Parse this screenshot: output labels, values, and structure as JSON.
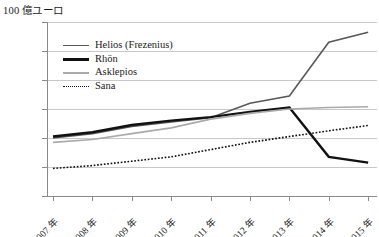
{
  "axis_unit_label": "100 億ユーロ",
  "legend": {
    "position": "upper-left-inside",
    "entries": [
      {
        "label": "Helios (Frezenius)",
        "color": "#595959",
        "style": "solid",
        "width": 1.6
      },
      {
        "label": "Rhön",
        "color": "#111111",
        "style": "solid",
        "width": 2.4
      },
      {
        "label": "Asklepios",
        "color": "#aaaaaa",
        "style": "solid",
        "width": 1.6
      },
      {
        "label": "Sana",
        "color": "#111111",
        "style": "dotted",
        "width": 1.6
      }
    ]
  },
  "chart_data": {
    "type": "line",
    "title": "",
    "xlabel": "",
    "ylabel": "100 億ユーロ",
    "ylim": [
      0,
      600
    ],
    "yticks": [
      0,
      100,
      200,
      300,
      400,
      500,
      600
    ],
    "ytick_labels": [
      "0",
      "100",
      "200",
      "300",
      "400",
      "500",
      "600"
    ],
    "grid": true,
    "categories": [
      "2007 年",
      "2008 年",
      "2009 年",
      "2010 年",
      "2011 年",
      "2012 年",
      "2013 年",
      "2014 年",
      "2015 年"
    ],
    "x": [
      2007,
      2008,
      2009,
      2010,
      2011,
      2012,
      2013,
      2014,
      2015
    ],
    "series": [
      {
        "name": "Helios (Frezenius)",
        "color": "#595959",
        "style": "solid",
        "width": 1.6,
        "values": [
          200,
          215,
          240,
          255,
          270,
          320,
          345,
          530,
          565
        ]
      },
      {
        "name": "Rhön",
        "color": "#111111",
        "style": "solid",
        "width": 2.4,
        "values": [
          205,
          220,
          245,
          260,
          272,
          290,
          305,
          135,
          115
        ]
      },
      {
        "name": "Asklepios",
        "color": "#aaaaaa",
        "style": "solid",
        "width": 1.6,
        "values": [
          185,
          195,
          215,
          235,
          265,
          285,
          300,
          305,
          308
        ]
      },
      {
        "name": "Sana",
        "color": "#111111",
        "style": "dotted",
        "width": 1.6,
        "values": [
          95,
          105,
          120,
          135,
          160,
          185,
          205,
          225,
          243
        ]
      }
    ]
  }
}
